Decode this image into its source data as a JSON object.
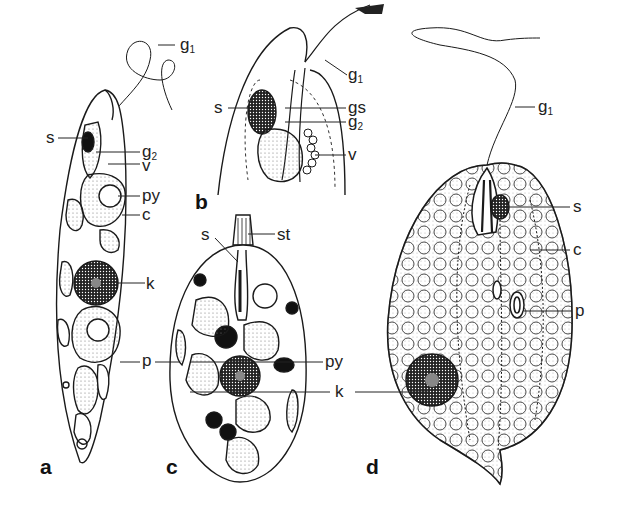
{
  "figure": {
    "panels": [
      {
        "id": "a",
        "letter": "a",
        "labels": [
          {
            "key": "g1",
            "base": "g",
            "sub": "1"
          },
          {
            "key": "s",
            "base": "s",
            "sub": ""
          },
          {
            "key": "g2",
            "base": "g",
            "sub": "2"
          },
          {
            "key": "v",
            "base": "v",
            "sub": ""
          },
          {
            "key": "py",
            "base": "py",
            "sub": ""
          },
          {
            "key": "c",
            "base": "c",
            "sub": ""
          },
          {
            "key": "k",
            "base": "k",
            "sub": ""
          },
          {
            "key": "p",
            "base": "p",
            "sub": ""
          }
        ]
      },
      {
        "id": "b",
        "letter": "b",
        "labels": [
          {
            "key": "g1",
            "base": "g",
            "sub": "1"
          },
          {
            "key": "s",
            "base": "s",
            "sub": ""
          },
          {
            "key": "gs",
            "base": "gs",
            "sub": ""
          },
          {
            "key": "g2",
            "base": "g",
            "sub": "2"
          },
          {
            "key": "v",
            "base": "v",
            "sub": ""
          }
        ]
      },
      {
        "id": "c",
        "letter": "c",
        "labels": [
          {
            "key": "s",
            "base": "s",
            "sub": ""
          },
          {
            "key": "st",
            "base": "st",
            "sub": ""
          },
          {
            "key": "py",
            "base": "py",
            "sub": ""
          },
          {
            "key": "k",
            "base": "k",
            "sub": ""
          }
        ]
      },
      {
        "id": "d",
        "letter": "d",
        "labels": [
          {
            "key": "g1",
            "base": "g",
            "sub": "1"
          },
          {
            "key": "s",
            "base": "s",
            "sub": ""
          },
          {
            "key": "c",
            "base": "c",
            "sub": ""
          },
          {
            "key": "p",
            "base": "p",
            "sub": ""
          }
        ]
      }
    ],
    "colors": {
      "ink": "#1a1a1a",
      "stipple": "#9a9a9a",
      "background": "#ffffff"
    }
  }
}
